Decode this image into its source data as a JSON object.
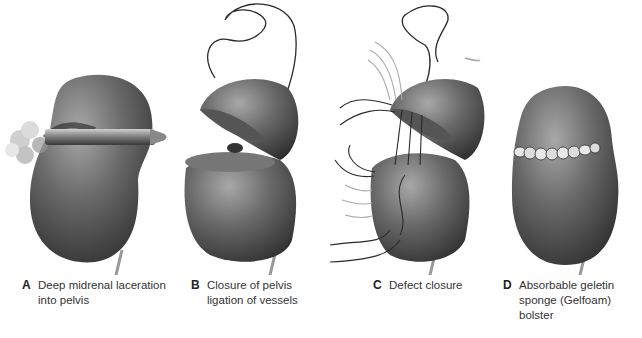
{
  "figure": {
    "panels": [
      {
        "letter": "A",
        "caption": "Deep midrenal laceration\ninto pelvis",
        "illustration": "kidney-gunshot-laceration"
      },
      {
        "letter": "B",
        "caption": "Closure of pelvis\nligation of vessels",
        "illustration": "kidney-opened-pelvis-closure"
      },
      {
        "letter": "C",
        "caption": "Defect closure",
        "illustration": "kidney-defect-sutures"
      },
      {
        "letter": "D",
        "caption": "Absorbable geletin\nsponge (Gelfoam) bolster",
        "illustration": "kidney-gelfoam-bolster"
      }
    ],
    "colors": {
      "kidney": "#5a5a5a",
      "kidney_highlight": "#9a9a9a",
      "suture": "#2a2a2a",
      "background": "#ffffff"
    }
  }
}
